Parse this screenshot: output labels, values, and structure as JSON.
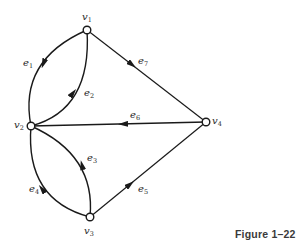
{
  "figure": {
    "caption": "Figure 1–22",
    "type": "directed-graph",
    "stroke_color": "#1a1a1a",
    "background": "#ffffff"
  },
  "vertices": [
    {
      "id": "v1",
      "base": "v",
      "sub": "1",
      "x": 87,
      "y": 30
    },
    {
      "id": "v2",
      "base": "v",
      "sub": "2",
      "x": 31,
      "y": 126
    },
    {
      "id": "v3",
      "base": "v",
      "sub": "3",
      "x": 90,
      "y": 217
    },
    {
      "id": "v4",
      "base": "v",
      "sub": "4",
      "x": 206,
      "y": 122
    }
  ],
  "edges": [
    {
      "id": "e1",
      "base": "e",
      "sub": "1",
      "from": "v1",
      "to": "v2",
      "shape": "arc-left"
    },
    {
      "id": "e2",
      "base": "e",
      "sub": "2",
      "from": "v2",
      "to": "v1",
      "shape": "arc-right"
    },
    {
      "id": "e3",
      "base": "e",
      "sub": "3",
      "from": "v3",
      "to": "v2",
      "shape": "arc-right"
    },
    {
      "id": "e4",
      "base": "e",
      "sub": "4",
      "from": "v3",
      "to": "v2",
      "shape": "arc-left"
    },
    {
      "id": "e5",
      "base": "e",
      "sub": "5",
      "from": "v3",
      "to": "v4",
      "shape": "straight"
    },
    {
      "id": "e6",
      "base": "e",
      "sub": "6",
      "from": "v4",
      "to": "v2",
      "shape": "straight"
    },
    {
      "id": "e7",
      "base": "e",
      "sub": "7",
      "from": "v1",
      "to": "v4",
      "shape": "straight"
    }
  ],
  "labels": {
    "v1": {
      "base": "v",
      "sub": "1"
    },
    "v2": {
      "base": "v",
      "sub": "2"
    },
    "v3": {
      "base": "v",
      "sub": "3"
    },
    "v4": {
      "base": "v",
      "sub": "4"
    },
    "e1": {
      "base": "e",
      "sub": "1"
    },
    "e2": {
      "base": "e",
      "sub": "2"
    },
    "e3": {
      "base": "e",
      "sub": "3"
    },
    "e4": {
      "base": "e",
      "sub": "4"
    },
    "e5": {
      "base": "e",
      "sub": "5"
    },
    "e6": {
      "base": "e",
      "sub": "6"
    },
    "e7": {
      "base": "e",
      "sub": "7"
    }
  }
}
